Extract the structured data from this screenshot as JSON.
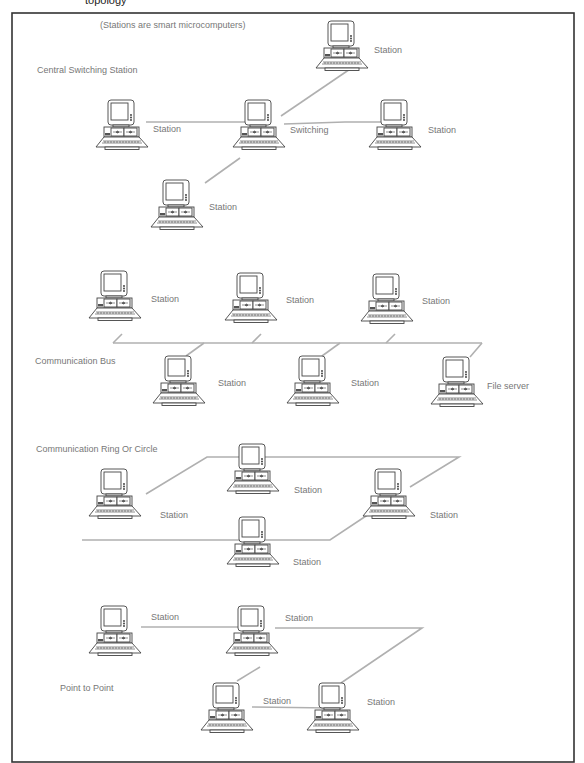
{
  "figure": {
    "top_cut_text": "topology",
    "note": "(Stations are smart microcomputers)",
    "line_color": "#b0b0b0",
    "frame_color": "#333333",
    "label_color": "#777777"
  },
  "sections": [
    {
      "id": "star",
      "title": "Central Switching Station",
      "title_pos": [
        37,
        73
      ],
      "nodes": [
        {
          "label": "Station",
          "x": 315,
          "y": 20,
          "lx": 374,
          "ly": 53
        },
        {
          "label": "Station",
          "x": 95,
          "y": 99,
          "lx": 153,
          "ly": 132
        },
        {
          "label": "Switching",
          "x": 232,
          "y": 99,
          "lx": 290,
          "ly": 133
        },
        {
          "label": "Station",
          "x": 368,
          "y": 99,
          "lx": 428,
          "ly": 133
        },
        {
          "label": "Station",
          "x": 150,
          "y": 179,
          "lx": 209,
          "ly": 210
        }
      ],
      "links": [
        "M146 122 L257 122",
        "M284 124 L345 122 L393 122",
        "M281 116 L356 65",
        "M205 183 L240 158"
      ]
    },
    {
      "id": "bus",
      "title": "Communication Bus",
      "title_pos": [
        35,
        364
      ],
      "nodes": [
        {
          "label": "Station",
          "x": 88,
          "y": 270,
          "lx": 151,
          "ly": 302
        },
        {
          "label": "Station",
          "x": 224,
          "y": 272,
          "lx": 286,
          "ly": 303
        },
        {
          "label": "Station",
          "x": 360,
          "y": 273,
          "lx": 422,
          "ly": 304
        },
        {
          "label": "Station",
          "x": 152,
          "y": 355,
          "lx": 218,
          "ly": 386
        },
        {
          "label": "Station",
          "x": 286,
          "y": 355,
          "lx": 351,
          "ly": 386
        },
        {
          "label": "File server",
          "x": 430,
          "y": 356,
          "lx": 487,
          "ly": 389
        }
      ],
      "links": [
        "M113 343 L482 343",
        "M113 343 L122 334",
        "M252 343 L261 334",
        "M386 343 L395 334",
        "M204 343 L186 356",
        "M340 343 L322 356",
        "M482 343 L470 357"
      ]
    },
    {
      "id": "ring",
      "title": "Communication Ring Or Circle",
      "title_pos": [
        36,
        452
      ],
      "nodes": [
        {
          "label": "Station",
          "x": 88,
          "y": 468,
          "lx": 160,
          "ly": 518
        },
        {
          "label": "Station",
          "x": 226,
          "y": 443,
          "lx": 294,
          "ly": 493
        },
        {
          "label": "Station",
          "x": 362,
          "y": 468,
          "lx": 430,
          "ly": 518
        },
        {
          "label": "Station",
          "x": 226,
          "y": 516,
          "lx": 293,
          "ly": 565
        }
      ],
      "links": [
        "M146 494 L207 457 L459 457 L410 487",
        "M82 540 L330 540 L372 512"
      ]
    },
    {
      "id": "p2p",
      "title": "Point to Point",
      "title_pos": [
        60,
        691
      ],
      "nodes": [
        {
          "label": "Station",
          "x": 88,
          "y": 605,
          "lx": 151,
          "ly": 620
        },
        {
          "label": "Station",
          "x": 225,
          "y": 605,
          "lx": 285,
          "ly": 621
        },
        {
          "label": "Station",
          "x": 200,
          "y": 682,
          "lx": 263,
          "ly": 704
        },
        {
          "label": "Station",
          "x": 306,
          "y": 682,
          "lx": 367,
          "ly": 705
        }
      ],
      "links": [
        "M141 627 L247 627",
        "M275 628 L422 628 L341 683",
        "M260 667 L237 681",
        "M252 707 L330 708"
      ]
    }
  ]
}
